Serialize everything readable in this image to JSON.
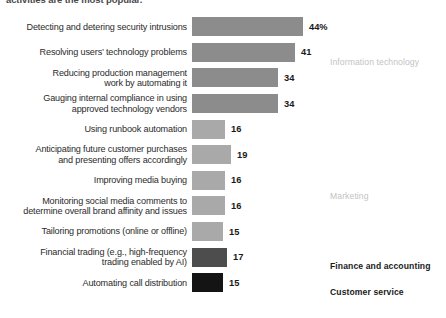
{
  "title": "activities are the most popular.",
  "chart_data": {
    "type": "bar",
    "orientation": "horizontal",
    "title": "activities are the most popular.",
    "xlabel": "",
    "ylabel": "",
    "xlim": [
      0,
      50
    ],
    "grid": false,
    "legend_position": "right",
    "value_suffix_first": "%",
    "categories": [
      "Detecting and detering security intrusions",
      "Resolving users’ technology problems",
      "Reducing production management work by automating it",
      "Gauging internal compliance in using approved technology vendors",
      "Using runbook automation",
      "Anticipating future customer purchases and presenting offers accordingly",
      "Improving media buying",
      "Monitoring social media comments to determine overall brand affinity and issues",
      "Tailoring promotions (online or offline)",
      "Financial trading (e.g., high-frequency trading enabled by AI)",
      "Automating call distribution"
    ],
    "values": [
      44,
      41,
      34,
      34,
      16,
      19,
      16,
      16,
      15,
      17,
      15
    ],
    "value_labels": [
      "44%",
      "41",
      "34",
      "34",
      "16",
      "19",
      "16",
      "16",
      "15",
      "17",
      "15"
    ],
    "groups": [
      {
        "name": "Information technology",
        "color": "#8c8c8c",
        "rows": [
          0,
          1,
          2,
          3
        ]
      },
      {
        "name": "Marketing",
        "color": "#a9a9a9",
        "rows": [
          4,
          5,
          6,
          7,
          8
        ]
      },
      {
        "name": "Finance and accounting",
        "color": "#4d4d4d",
        "rows": [
          9
        ]
      },
      {
        "name": "Customer service",
        "color": "#141414",
        "rows": [
          10
        ]
      }
    ]
  },
  "rows": [
    {
      "line1": "Detecting and detering security intrusions",
      "line2": "",
      "value": "44%",
      "width": 111,
      "tier": "tier-it"
    },
    {
      "line1": "Resolving users’ technology problems",
      "line2": "",
      "value": "41",
      "width": 103,
      "tier": "tier-it"
    },
    {
      "line1": "Reducing production management",
      "line2": "work by automating it",
      "value": "34",
      "width": 86,
      "tier": "tier-it"
    },
    {
      "line1": "Gauging internal compliance in using",
      "line2": "approved technology vendors",
      "value": "34",
      "width": 86,
      "tier": "tier-it"
    },
    {
      "line1": "Using runbook automation",
      "line2": "",
      "value": "16",
      "width": 33,
      "tier": "tier-mkt"
    },
    {
      "line1": "Anticipating future customer purchases",
      "line2": "and presenting offers accordingly",
      "value": "19",
      "width": 39,
      "tier": "tier-mkt"
    },
    {
      "line1": "Improving media buying",
      "line2": "",
      "value": "16",
      "width": 33,
      "tier": "tier-mkt"
    },
    {
      "line1": "Monitoring social media comments to",
      "line2": "determine overall brand affinity and issues",
      "value": "16",
      "width": 33,
      "tier": "tier-mkt"
    },
    {
      "line1": "Tailoring promotions (online or offline)",
      "line2": "",
      "value": "15",
      "width": 31,
      "tier": "tier-mkt"
    },
    {
      "line1": "Financial trading (e.g., high-frequency",
      "line2": "trading enabled by AI)",
      "value": "17",
      "width": 35,
      "tier": "tier-fin"
    },
    {
      "line1": "Automating call distribution",
      "line2": "",
      "value": "15",
      "width": 31,
      "tier": "tier-cs"
    }
  ],
  "category_labels": {
    "information_technology": "Information technology",
    "marketing": "Marketing",
    "finance_and_accounting": "Finance and accounting",
    "customer_service": "Customer service"
  }
}
